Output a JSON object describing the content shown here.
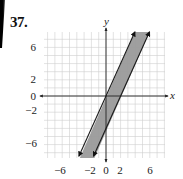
{
  "problem_number": "37.",
  "chart_data": {
    "type": "line",
    "title": "",
    "xlabel": "x",
    "ylabel": "y",
    "xlim": [
      -8.5,
      8
    ],
    "ylim": [
      -8,
      8
    ],
    "grid": true,
    "x_ticks": [
      -6,
      -2,
      0,
      2,
      6
    ],
    "x_tick_labels": [
      "−6",
      "−2",
      "0",
      "2",
      "6"
    ],
    "y_ticks": [
      6,
      2,
      0,
      -2,
      -6
    ],
    "y_tick_labels": [
      "6",
      "2",
      "0",
      "−2",
      "−6"
    ],
    "series": [
      {
        "name": "boundary line 1",
        "equation": "y = 2x",
        "slope": 2,
        "intercept": 0,
        "style": "solid",
        "arrows": "both"
      },
      {
        "name": "boundary line 2",
        "equation": "y = 2x - 4",
        "slope": 2,
        "intercept": -4,
        "style": "solid",
        "arrows": "both"
      }
    ],
    "shaded_region": "2x - 4 <= y <= 2x",
    "colors": {
      "shade": "#9a9a9a",
      "line": "#222222",
      "grid": "#cfcfcf",
      "axis": "#222222"
    }
  }
}
